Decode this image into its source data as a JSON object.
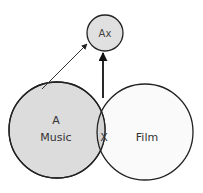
{
  "diagram": {
    "nodes": {
      "ax": {
        "label": "Ax",
        "fill": "#e0e0e0"
      },
      "music": {
        "letter": "A",
        "label": "Music",
        "fill": "#dcdcdc"
      },
      "film": {
        "label": "Film",
        "fill": "#fafafa"
      },
      "intersection": {
        "label": "X",
        "fill": "#d4d4d4"
      }
    },
    "edges": [
      {
        "from": "music",
        "to": "ax",
        "style": "thin"
      },
      {
        "from": "intersection",
        "to": "ax",
        "style": "thick"
      }
    ],
    "colors": {
      "stroke": "#222222",
      "text": "#333333"
    }
  }
}
